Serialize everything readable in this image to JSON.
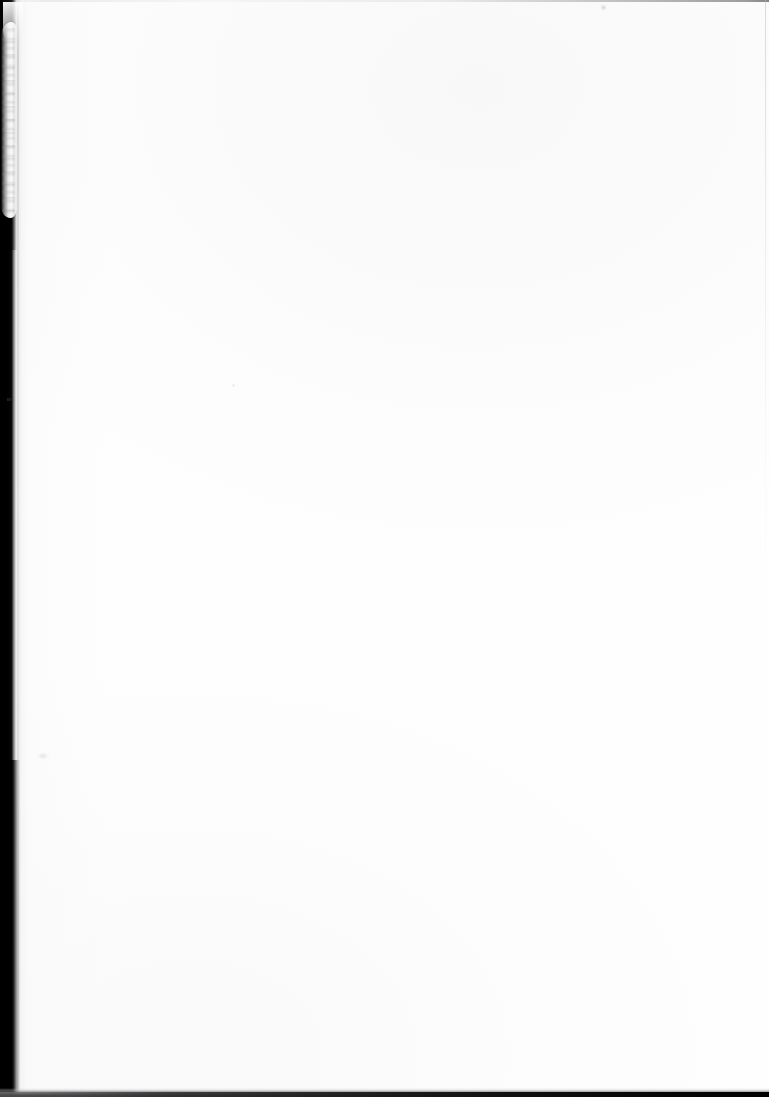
{
  "document": {
    "kind": "scanned-page",
    "title": "",
    "body_text": "",
    "page_number": "",
    "caption": "",
    "note": ""
  },
  "page": {
    "width_px": 769,
    "height_px": 1097,
    "background_color": "#ffffff",
    "paper_color": "#fefefe"
  },
  "artifacts": {
    "gutter": {
      "name": "left-scanner-gutter",
      "color": "#000000",
      "edge": "left"
    },
    "curl": {
      "name": "page-curl-highlight",
      "color": "#ffffff",
      "edge": "upper-left"
    },
    "top_edge": {
      "name": "top-scan-edge-line",
      "color": "#8c8c90"
    },
    "right_edge": {
      "name": "right-scan-edge-line",
      "color": "#bebec1"
    },
    "bottom_edge": {
      "name": "bottom-scan-edge-band",
      "color": "#000000"
    },
    "specks": [
      {
        "name": "speck-upper-right",
        "color": "#b2b2b6"
      },
      {
        "name": "speck-mid-left",
        "color": "#cdcdd1"
      },
      {
        "name": "speck-lower-left",
        "color": "#c4c4c8"
      },
      {
        "name": "gutter-nick",
        "color": "#464648"
      }
    ]
  }
}
